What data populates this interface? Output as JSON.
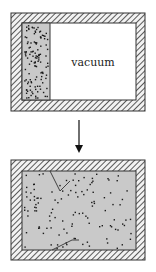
{
  "figure": {
    "before": {
      "vacuum_label": "vacuum",
      "gas_fraction_of_volume": 0.25
    },
    "transition": {
      "arrow_direction": "down"
    },
    "after": {
      "gas_fills_container": true,
      "trajectory_lines": 2
    },
    "colors": {
      "gas_fill": "#c9c9c9",
      "vacuum_fill": "#ffffff",
      "wall_stroke": "#333333",
      "molecule": "#1a1a1a"
    }
  }
}
